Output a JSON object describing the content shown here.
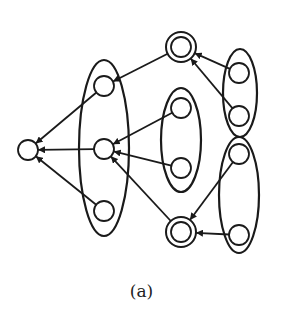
{
  "caption": "(a)",
  "colors": {
    "stroke": "#1a1a1a",
    "fill": "#ffffff"
  },
  "nodes": [
    {
      "id": "root",
      "x": 28,
      "y": 150,
      "double": false
    },
    {
      "id": "L1",
      "x": 104,
      "y": 86,
      "double": false
    },
    {
      "id": "L2",
      "x": 104,
      "y": 149,
      "double": false
    },
    {
      "id": "L3",
      "x": 104,
      "y": 211,
      "double": false
    },
    {
      "id": "M1",
      "x": 181,
      "y": 108,
      "double": false
    },
    {
      "id": "M2",
      "x": 181,
      "y": 168,
      "double": false
    },
    {
      "id": "T",
      "x": 181,
      "y": 47,
      "double": true
    },
    {
      "id": "B",
      "x": 181,
      "y": 232,
      "double": true
    },
    {
      "id": "RU1",
      "x": 239,
      "y": 73,
      "double": false
    },
    {
      "id": "RU2",
      "x": 239,
      "y": 116,
      "double": false
    },
    {
      "id": "RL1",
      "x": 239,
      "y": 154,
      "double": false
    },
    {
      "id": "RL2",
      "x": 239,
      "y": 235,
      "double": false
    }
  ],
  "groups": [
    {
      "id": "left-group",
      "cx": 104,
      "cy": 148,
      "rx": 25,
      "ry": 88
    },
    {
      "id": "middle-group",
      "cx": 181,
      "cy": 140,
      "rx": 20,
      "ry": 52
    },
    {
      "id": "right-upper-group",
      "cx": 240,
      "cy": 93,
      "rx": 17,
      "ry": 44
    },
    {
      "id": "right-lower-group",
      "cx": 239,
      "cy": 195,
      "rx": 20,
      "ry": 58
    }
  ],
  "edges": [
    {
      "from": "L1",
      "to": "root"
    },
    {
      "from": "L2",
      "to": "root"
    },
    {
      "from": "L3",
      "to": "root"
    },
    {
      "from": "T",
      "to": "L1"
    },
    {
      "from": "M1",
      "to": "L2"
    },
    {
      "from": "M2",
      "to": "L2"
    },
    {
      "from": "B",
      "to": "L2"
    },
    {
      "from": "RU1",
      "to": "T"
    },
    {
      "from": "RU2",
      "to": "T"
    },
    {
      "from": "RL1",
      "to": "B"
    },
    {
      "from": "RL2",
      "to": "B"
    }
  ]
}
